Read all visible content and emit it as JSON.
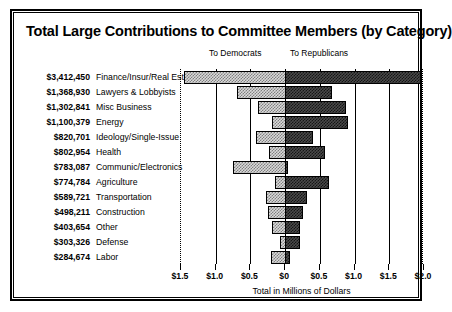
{
  "chart_data": {
    "type": "bar",
    "title": "Total Large Contributions to Committee Members (by Category)",
    "subtype": "diverging-horizontal-bar",
    "xlabel": "Total in Millions of Dollars",
    "ylabel": "",
    "grid": true,
    "legend_position": "top",
    "legend": [
      "To Democrats",
      "To Republicans"
    ],
    "axis_zero_value": "$0",
    "xlim_left_millions": 1.5,
    "xlim_right_millions": 2.0,
    "tick_labels": [
      "$1.5",
      "$1.0",
      "$0.5",
      "$0",
      "$0.5",
      "$1.0",
      "$1.5",
      "$2.0"
    ],
    "tick_values_millions": [
      -1.5,
      -1.0,
      -0.5,
      0,
      0.5,
      1.0,
      1.5,
      2.0
    ],
    "categories": [
      "Finance/Insur/Real Est",
      "Lawyers & Lobbyists",
      "Misc Business",
      "Energy",
      "Ideology/Single-Issue",
      "Health",
      "Communic/Electronics",
      "Agriculture",
      "Transportation",
      "Construction",
      "Other",
      "Defense",
      "Labor"
    ],
    "totals": [
      "$3,412,450",
      "$1,368,930",
      "$1,302,841",
      "$1,100,379",
      "$820,701",
      "$802,954",
      "$783,087",
      "$774,784",
      "$589,721",
      "$498,211",
      "$403,654",
      "$303,326",
      "$284,674"
    ],
    "series": [
      {
        "name": "To Democrats",
        "color": "#d9d9d9",
        "values": [
          1.45,
          0.69,
          0.39,
          0.19,
          0.42,
          0.23,
          0.75,
          0.14,
          0.28,
          0.24,
          0.19,
          0.08,
          0.21
        ]
      },
      {
        "name": "To Republicans",
        "color": "#4a4a4a",
        "values": [
          1.96,
          0.68,
          0.88,
          0.91,
          0.4,
          0.57,
          0.04,
          0.63,
          0.31,
          0.26,
          0.21,
          0.22,
          0.07
        ]
      }
    ]
  }
}
